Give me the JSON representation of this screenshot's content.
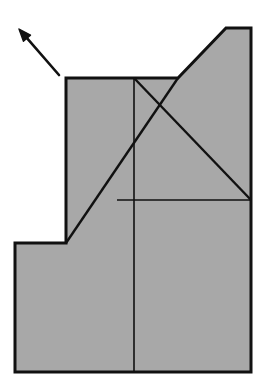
{
  "figure": {
    "background_color": "#ffffff",
    "fill_color": "#a8a8a8",
    "stroke_color": "#111111",
    "canvas": {
      "width": 266,
      "height": 389
    }
  },
  "outline": {
    "name": "stepped-block-outline",
    "stroke_width": 3,
    "points": "15,243 66,243 66,78 178,78 226,28 251,28 251,372 15,372",
    "vertices": [
      {
        "x": 15,
        "y": 243,
        "label": "lower-step-left-top"
      },
      {
        "x": 66,
        "y": 243,
        "label": "lower-step-inner-corner"
      },
      {
        "x": 66,
        "y": 78,
        "label": "upper-left-corner"
      },
      {
        "x": 178,
        "y": 78,
        "label": "upper-ledge-right"
      },
      {
        "x": 226,
        "y": 28,
        "label": "top-peak-left"
      },
      {
        "x": 251,
        "y": 28,
        "label": "top-right-corner"
      },
      {
        "x": 251,
        "y": 372,
        "label": "bottom-right-corner"
      },
      {
        "x": 15,
        "y": 372,
        "label": "bottom-left-corner"
      }
    ]
  },
  "interior_lines": [
    {
      "name": "center-vertical-line",
      "x1": 134,
      "y1": 78,
      "x2": 134,
      "y2": 372,
      "stroke_width": 1.6
    },
    {
      "name": "rising-diagonal-line",
      "x1": 66,
      "y1": 243,
      "x2": 178,
      "y2": 78,
      "stroke_width": 2.4
    },
    {
      "name": "falling-diagonal-line",
      "x1": 134,
      "y1": 78,
      "x2": 251,
      "y2": 200,
      "stroke_width": 2.4
    },
    {
      "name": "mid-horizontal-line",
      "x1": 117,
      "y1": 200,
      "x2": 251,
      "y2": 200,
      "stroke_width": 1.6
    }
  ],
  "annotations": {
    "view_arrow": {
      "name": "view-direction-arrow",
      "description": "arrow pointing up-left",
      "tail_x": 59,
      "tail_y": 75,
      "tip_x": 19,
      "tip_y": 29,
      "stroke_width": 2.6,
      "head_size": 9
    }
  },
  "chart_data": {
    "type": "diagram",
    "shape_outline": [
      [
        15,
        243
      ],
      [
        66,
        243
      ],
      [
        66,
        78
      ],
      [
        178,
        78
      ],
      [
        226,
        28
      ],
      [
        251,
        28
      ],
      [
        251,
        372
      ],
      [
        15,
        372
      ]
    ],
    "internal_edges": [
      {
        "from": [
          134,
          78
        ],
        "to": [
          134,
          372
        ]
      },
      {
        "from": [
          66,
          243
        ],
        "to": [
          178,
          78
        ]
      },
      {
        "from": [
          134,
          78
        ],
        "to": [
          251,
          200
        ]
      },
      {
        "from": [
          117,
          200
        ],
        "to": [
          251,
          200
        ]
      }
    ],
    "arrow": {
      "from": [
        59,
        75
      ],
      "to": [
        19,
        29
      ]
    },
    "fill": "#a8a8a8",
    "stroke": "#111111"
  }
}
